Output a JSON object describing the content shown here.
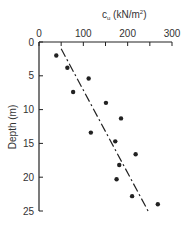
{
  "chart_data": {
    "type": "scatter",
    "title": "",
    "xlabel": "c_u (kN/m²)",
    "xlabel_main": "c",
    "xlabel_sub": "u",
    "xlabel_rest": " (kN/m",
    "xlabel_sup": "2",
    "xlabel_end": ")",
    "ylabel": "Depth (m)",
    "xlim": [
      0,
      300
    ],
    "ylim": [
      0,
      25
    ],
    "y_inverted": true,
    "x_axis_position": "top",
    "x_ticks": [
      0,
      100,
      200,
      300
    ],
    "x_minor_ticks": [
      50,
      150,
      250
    ],
    "y_ticks": [
      0,
      5,
      10,
      15,
      20,
      25
    ],
    "grid": false,
    "legend": null,
    "series": [
      {
        "name": "measured c_u",
        "marker": "filled-circle",
        "points": [
          {
            "cu": 39,
            "depth": 2.0
          },
          {
            "cu": 64,
            "depth": 3.8
          },
          {
            "cu": 112,
            "depth": 5.4
          },
          {
            "cu": 77,
            "depth": 7.4
          },
          {
            "cu": 151,
            "depth": 9.0
          },
          {
            "cu": 185,
            "depth": 11.3
          },
          {
            "cu": 117,
            "depth": 13.4
          },
          {
            "cu": 172,
            "depth": 14.7
          },
          {
            "cu": 218,
            "depth": 16.6
          },
          {
            "cu": 181,
            "depth": 18.2
          },
          {
            "cu": 175,
            "depth": 20.3
          },
          {
            "cu": 210,
            "depth": 22.8
          },
          {
            "cu": 268,
            "depth": 24.0
          }
        ]
      },
      {
        "name": "trend line",
        "style": "dash-dot",
        "points": [
          {
            "cu": 50,
            "depth": 1.0
          },
          {
            "cu": 246,
            "depth": 25.0
          }
        ]
      }
    ]
  },
  "colors": {
    "ink": "#222222",
    "background": "#ffffff"
  }
}
